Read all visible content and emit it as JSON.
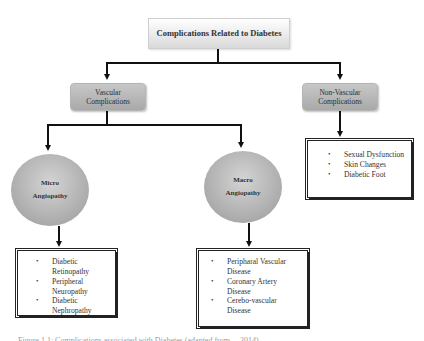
{
  "diagram": {
    "root": {
      "label": "Complications Related to Diabetes"
    },
    "categories": [
      {
        "id": "vascular",
        "label": "Vascular Complications"
      },
      {
        "id": "non_vascular",
        "label": "Non-Vascular Complications"
      }
    ],
    "subcategories": [
      {
        "id": "micro",
        "parent": "vascular",
        "line1": "Micro",
        "line2": "Angiopathy"
      },
      {
        "id": "macro",
        "parent": "vascular",
        "line1": "Macro",
        "line2": "Angiopathy"
      }
    ],
    "lists": {
      "micro": [
        "Diabetic Retinopathy",
        "Peripheral Neuropathy",
        "Diabetic Nephropathy"
      ],
      "macro": [
        "Peripharal Vascular Disease",
        "Coronary Artery Disease",
        "Cerebo-vascular Disease"
      ],
      "non_vascular": [
        "Sexual Dysfunction",
        "Skin Changes",
        "Diabetic Foot"
      ]
    },
    "edges": [
      [
        "root",
        "vascular"
      ],
      [
        "root",
        "non_vascular"
      ],
      [
        "vascular",
        "micro"
      ],
      [
        "vascular",
        "macro"
      ],
      [
        "micro",
        "micro_list"
      ],
      [
        "macro",
        "macro_list"
      ],
      [
        "non_vascular",
        "non_vascular_list"
      ]
    ],
    "caption": "Figure 1.1: Complications associated with Diabetes (adapted from ... 2014)"
  },
  "colors": {
    "root_fill_top": "#ffffff",
    "root_fill_bottom": "#d9d9d9",
    "category_fill": "#b8b8b8",
    "circle_fill": "#bdbdbd",
    "line": "#111111"
  }
}
